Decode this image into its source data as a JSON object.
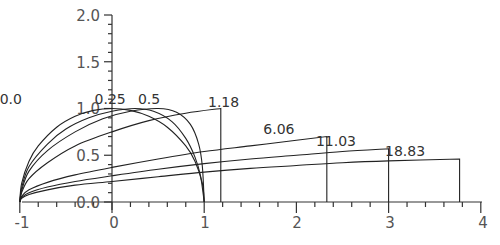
{
  "chart_data": {
    "type": "line",
    "title": "",
    "xlabel": "",
    "ylabel": "",
    "xlim": [
      -1,
      4
    ],
    "ylim": [
      0,
      2.0
    ],
    "grid": false,
    "legend": "none (curves labeled inline)",
    "x_ticks": [
      "-1",
      "0",
      "1",
      "2",
      "3",
      "4"
    ],
    "y_ticks": [
      "0.0",
      "0.5",
      "1.0",
      "1.5",
      "2.0"
    ],
    "series": [
      {
        "name": "0.0",
        "label_pos": [
          -0.98,
          1.05
        ],
        "points": [
          [
            -1,
            0
          ],
          [
            -0.98,
            0.2
          ],
          [
            -0.9,
            0.436
          ],
          [
            -0.8,
            0.6
          ],
          [
            -0.6,
            0.8
          ],
          [
            -0.4,
            0.917
          ],
          [
            -0.2,
            0.98
          ],
          [
            0,
            1.0
          ],
          [
            0.2,
            0.98
          ],
          [
            0.4,
            0.917
          ],
          [
            0.6,
            0.8
          ],
          [
            0.8,
            0.6
          ],
          [
            0.9,
            0.436
          ],
          [
            0.98,
            0.2
          ],
          [
            1,
            0
          ]
        ]
      },
      {
        "name": "0.25",
        "label_pos": [
          0.05,
          1.05
        ],
        "points": [
          [
            -1,
            0
          ],
          [
            -0.98,
            0.15
          ],
          [
            -0.9,
            0.38
          ],
          [
            -0.7,
            0.62
          ],
          [
            -0.5,
            0.78
          ],
          [
            -0.25,
            0.9
          ],
          [
            0,
            0.97
          ],
          [
            0.25,
            1.0
          ],
          [
            0.45,
            0.97
          ],
          [
            0.65,
            0.86
          ],
          [
            0.8,
            0.68
          ],
          [
            0.9,
            0.48
          ],
          [
            0.96,
            0.28
          ],
          [
            1,
            0
          ]
        ]
      },
      {
        "name": "0.5",
        "label_pos": [
          0.52,
          1.05
        ],
        "points": [
          [
            -1,
            0
          ],
          [
            -0.98,
            0.12
          ],
          [
            -0.9,
            0.33
          ],
          [
            -0.7,
            0.55
          ],
          [
            -0.4,
            0.75
          ],
          [
            -0.1,
            0.89
          ],
          [
            0.2,
            0.97
          ],
          [
            0.5,
            1.0
          ],
          [
            0.7,
            0.96
          ],
          [
            0.85,
            0.83
          ],
          [
            0.94,
            0.62
          ],
          [
            0.98,
            0.38
          ],
          [
            1,
            0
          ]
        ]
      },
      {
        "name": "1.18",
        "label_pos": [
          1.28,
          1.02
        ],
        "points": [
          [
            -1,
            0
          ],
          [
            -0.98,
            0.1
          ],
          [
            -0.9,
            0.25
          ],
          [
            -0.7,
            0.42
          ],
          [
            -0.4,
            0.6
          ],
          [
            0,
            0.75
          ],
          [
            0.4,
            0.87
          ],
          [
            0.8,
            0.95
          ],
          [
            1.18,
            1.0
          ],
          [
            1.18,
            0
          ]
        ]
      },
      {
        "name": "6.06",
        "label_pos": [
          1.88,
          0.73
        ],
        "points": [
          [
            -1,
            0
          ],
          [
            -0.98,
            0.06
          ],
          [
            -0.9,
            0.13
          ],
          [
            -0.7,
            0.21
          ],
          [
            -0.4,
            0.29
          ],
          [
            0,
            0.37
          ],
          [
            0.5,
            0.46
          ],
          [
            1.0,
            0.54
          ],
          [
            1.5,
            0.6
          ],
          [
            2.0,
            0.66
          ],
          [
            2.33,
            0.7
          ],
          [
            2.33,
            0
          ]
        ]
      },
      {
        "name": "11.03",
        "label_pos": [
          2.45,
          0.6
        ],
        "points": [
          [
            -1,
            0
          ],
          [
            -0.98,
            0.05
          ],
          [
            -0.9,
            0.1
          ],
          [
            -0.7,
            0.16
          ],
          [
            -0.4,
            0.22
          ],
          [
            0,
            0.28
          ],
          [
            0.5,
            0.35
          ],
          [
            1.0,
            0.41
          ],
          [
            1.5,
            0.46
          ],
          [
            2.0,
            0.5
          ],
          [
            2.5,
            0.54
          ],
          [
            3.0,
            0.57
          ],
          [
            3.0,
            0
          ]
        ]
      },
      {
        "name": "18.83",
        "label_pos": [
          3.2,
          0.49
        ],
        "points": [
          [
            -1,
            0
          ],
          [
            -0.98,
            0.04
          ],
          [
            -0.9,
            0.08
          ],
          [
            -0.7,
            0.13
          ],
          [
            -0.4,
            0.18
          ],
          [
            0,
            0.22
          ],
          [
            0.5,
            0.27
          ],
          [
            1.0,
            0.32
          ],
          [
            1.5,
            0.36
          ],
          [
            2.0,
            0.39
          ],
          [
            2.5,
            0.42
          ],
          [
            3.0,
            0.44
          ],
          [
            3.77,
            0.46
          ],
          [
            3.77,
            0
          ]
        ]
      }
    ]
  },
  "axes": {
    "x_tick_labels": [
      "-1",
      "0",
      "1",
      "2",
      "3",
      "4"
    ],
    "y_tick_labels": [
      "0.0",
      "0.5",
      "1.0",
      "1.5",
      "2.0"
    ]
  }
}
